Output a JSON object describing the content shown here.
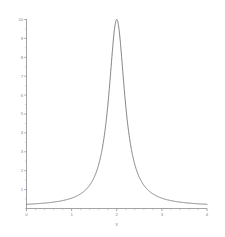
{
  "chart_data": {
    "type": "line",
    "title": "",
    "subtitle": "",
    "xlabel": "x",
    "ylabel": "",
    "xlim": [
      0,
      4
    ],
    "ylim": [
      0,
      10
    ],
    "grid": false,
    "legend": null,
    "legend_position": "none",
    "line_color": "#6e6e6e",
    "axis_color": "#8a8a8a",
    "background_color": "#ffffff",
    "x_ticks_major": [
      0,
      1,
      2,
      3,
      4
    ],
    "x_tick_labels": [
      "0",
      "1",
      "2",
      "3",
      "4"
    ],
    "x_minor_tick_step": 0.2,
    "y_ticks_major": [
      1,
      2,
      3,
      4,
      5,
      6,
      7,
      8,
      9,
      10
    ],
    "y_tick_labels": [
      "1",
      "2",
      "3",
      "4",
      "5",
      "6",
      "7",
      "8",
      "9",
      "10"
    ],
    "y_minor_tick_step": 0.5,
    "peak": {
      "x": 2,
      "y": 10
    },
    "half_width_half_max": 0.215,
    "x": [
      0.0,
      0.1,
      0.2,
      0.3,
      0.4,
      0.5,
      0.6,
      0.7,
      0.8,
      0.9,
      1.0,
      1.1,
      1.2,
      1.3,
      1.4,
      1.45,
      1.5,
      1.55,
      1.6,
      1.65,
      1.7,
      1.75,
      1.78,
      1.8,
      1.82,
      1.85,
      1.88,
      1.9,
      1.92,
      1.94,
      1.96,
      1.98,
      2.0,
      2.02,
      2.04,
      2.06,
      2.08,
      2.1,
      2.12,
      2.15,
      2.18,
      2.2,
      2.22,
      2.25,
      2.3,
      2.35,
      2.4,
      2.45,
      2.5,
      2.55,
      2.6,
      2.7,
      2.8,
      2.9,
      3.0,
      3.1,
      3.2,
      3.3,
      3.4,
      3.5,
      3.6,
      3.7,
      3.8,
      3.9,
      4.0
    ],
    "values": [
      0.11,
      0.13,
      0.15,
      0.17,
      0.2,
      0.24,
      0.29,
      0.36,
      0.46,
      0.6,
      0.8,
      1.09,
      1.54,
      2.25,
      3.43,
      4.21,
      5.15,
      6.2,
      7.28,
      8.26,
      9.02,
      9.53,
      9.71,
      9.8,
      9.86,
      9.92,
      9.96,
      9.97,
      9.99,
      9.99,
      10.0,
      10.0,
      10.0,
      10.0,
      10.0,
      9.99,
      9.99,
      9.97,
      9.96,
      9.92,
      9.86,
      9.8,
      9.71,
      9.53,
      9.02,
      8.26,
      7.28,
      6.2,
      5.15,
      4.21,
      3.43,
      2.25,
      1.54,
      1.09,
      0.8,
      0.6,
      0.46,
      0.36,
      0.29,
      0.24,
      0.2,
      0.17,
      0.15,
      0.13,
      0.11
    ]
  },
  "axis": {
    "x_label": "x"
  }
}
